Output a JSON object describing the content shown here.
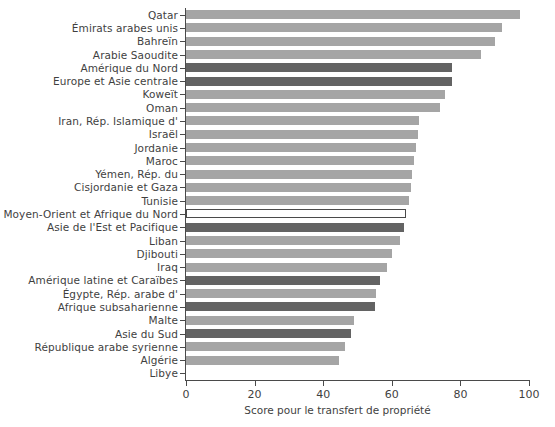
{
  "chart_data": {
    "type": "bar",
    "orientation": "horizontal",
    "title": "",
    "xlabel": "Score pour le transfert de propriété",
    "ylabel": "",
    "xlim": [
      0,
      100
    ],
    "xticks": [
      0,
      20,
      40,
      60,
      80,
      100
    ],
    "grid": true,
    "grid_axis": "x",
    "legend": null,
    "colors": {
      "light": "#a5a5a5",
      "dark": "#636363",
      "highlight_fill": "#ffffff",
      "highlight_edge": "#4a4a4a",
      "axis": "#4a4a4a",
      "text": "#3f3f3f"
    },
    "categories": [
      "Qatar",
      "Émirats arabes unis",
      "Bahreïn",
      "Arabie Saoudite",
      "Amérique du Nord",
      "Europe et Asie centrale",
      "Koweït",
      "Oman",
      "Iran, Rép. Islamique d'",
      "Israël",
      "Jordanie",
      "Maroc",
      "Yémen, Rép. du",
      "Cisjordanie et Gaza",
      "Tunisie",
      "Moyen-Orient et Afrique du Nord",
      "Asie de l'Est et Pacifique",
      "Liban",
      "Djibouti",
      "Iraq",
      "Amérique latine et Caraïbes",
      "Égypte, Rép. arabe d'",
      "Afrique subsaharienne",
      "Malte",
      "Asie du Sud",
      "République arabe syrienne",
      "Algérie",
      "Libye"
    ],
    "values": [
      97.5,
      92.0,
      90.0,
      86.0,
      77.5,
      77.5,
      75.5,
      74.0,
      68.0,
      67.5,
      67.0,
      66.5,
      66.0,
      65.5,
      65.0,
      64.0,
      63.5,
      62.5,
      60.0,
      58.5,
      56.5,
      55.5,
      55.0,
      49.0,
      48.0,
      46.5,
      44.5,
      0.0
    ],
    "series_styles": [
      "light",
      "light",
      "light",
      "light",
      "dark",
      "dark",
      "light",
      "light",
      "light",
      "light",
      "light",
      "light",
      "light",
      "light",
      "light",
      "highlight",
      "dark",
      "light",
      "light",
      "light",
      "dark",
      "light",
      "dark",
      "light",
      "dark",
      "light",
      "light",
      "light"
    ]
  }
}
